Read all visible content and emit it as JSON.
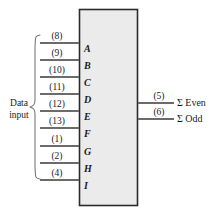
{
  "diagram": {
    "background_color": "#ffffff",
    "chip": {
      "fill_color": "#ebebeb",
      "border_color": "#2b2b2b",
      "x": 79,
      "y": 9,
      "width": 59,
      "height": 197
    },
    "group_label": {
      "line1": "Data",
      "line2": "input",
      "brace": "{"
    },
    "inputs": [
      {
        "pin": "(8)",
        "letter": "A",
        "y": 43
      },
      {
        "pin": "(9)",
        "letter": "B",
        "y": 60
      },
      {
        "pin": "(10)",
        "letter": "C",
        "y": 77
      },
      {
        "pin": "(11)",
        "letter": "D",
        "y": 94
      },
      {
        "pin": "(12)",
        "letter": "E",
        "y": 111
      },
      {
        "pin": "(13)",
        "letter": "F",
        "y": 128
      },
      {
        "pin": "(1)",
        "letter": "G",
        "y": 146
      },
      {
        "pin": "(2)",
        "letter": "H",
        "y": 163
      },
      {
        "pin": "(4)",
        "letter": "I",
        "y": 180
      }
    ],
    "outputs": [
      {
        "pin": "(5)",
        "label": "Σ Even",
        "y": 103
      },
      {
        "pin": "(6)",
        "label": "Σ Odd",
        "y": 119
      }
    ]
  }
}
